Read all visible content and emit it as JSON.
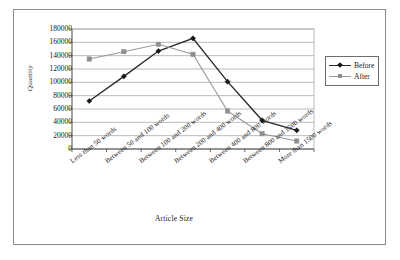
{
  "chart_data": {
    "type": "line",
    "title": "",
    "xlabel": "Article Size",
    "ylabel": "Quantity",
    "ylim": [
      0,
      180000
    ],
    "ytick_step": 20000,
    "yticks": [
      "180000",
      "160000",
      "140000",
      "120000",
      "100000",
      "80000",
      "60000",
      "40000",
      "20000",
      "0"
    ],
    "grid": true,
    "legend_position": "right",
    "categories": [
      "Less than 50 words",
      "Between 50 and 100 words",
      "Between 100 and 200 words",
      "Between 200 and 400 words",
      "Between 400 and 800 words",
      "Between 800 and 1500 words",
      "More than 1500 words"
    ],
    "series": [
      {
        "name": "Before",
        "color": "#2b2b2b",
        "marker": "diamond",
        "values": [
          72000,
          109000,
          147000,
          166000,
          101000,
          43000,
          28000
        ]
      },
      {
        "name": "After",
        "color": "#9a9a9a",
        "marker": "square",
        "values": [
          135000,
          146000,
          157000,
          142000,
          57000,
          23000,
          12000
        ]
      }
    ]
  },
  "legend": {
    "items": [
      {
        "label": "Before"
      },
      {
        "label": "After"
      }
    ]
  }
}
